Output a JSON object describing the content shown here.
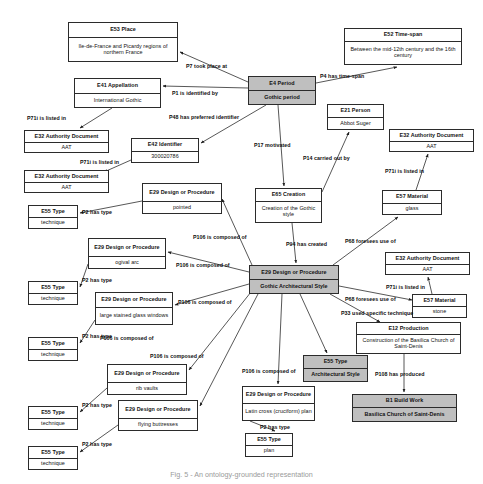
{
  "diagram": {
    "caption": "Fig. 5 - An ontology-grounded representation",
    "accent_shaded": "#bfbfbf",
    "stroke": "#2b2b2b"
  },
  "nodes": [
    {
      "id": "e53_place",
      "cls": "E53 Place",
      "val": "Ile-de-France and Picardy regions of northern France",
      "shaded": false,
      "x": 68,
      "y": 22,
      "w": 110,
      "h": 40,
      "clsh": 15
    },
    {
      "id": "e52_timespan",
      "cls": "E52 Time-span",
      "val": "Between the mid-12th century and the 16th century",
      "shaded": false,
      "x": 344,
      "y": 28,
      "w": 118,
      "h": 37,
      "clsh": 13
    },
    {
      "id": "e41_appellation",
      "cls": "E41 Appellation",
      "val": "International Gothic",
      "shaded": false,
      "x": 74,
      "y": 78,
      "w": 87,
      "h": 30,
      "clsh": 15
    },
    {
      "id": "e4_period",
      "cls": "E4 Period",
      "val": "Gothic period",
      "shaded": true,
      "x": 248,
      "y": 76,
      "w": 68,
      "h": 29,
      "clsh": 14
    },
    {
      "id": "e21_person",
      "cls": "E21 Person",
      "val": "Abbot Suger",
      "shaded": false,
      "x": 327,
      "y": 104,
      "w": 57,
      "h": 26,
      "clsh": 13
    },
    {
      "id": "e32_aat_1",
      "cls": "E32 Authority Document",
      "val": "AAT",
      "shaded": false,
      "x": 24,
      "y": 130,
      "w": 85,
      "h": 23,
      "clsh": 12
    },
    {
      "id": "e42_identifier",
      "cls": "E42 Identifier",
      "val": "300020786",
      "shaded": false,
      "x": 131,
      "y": 138,
      "w": 68,
      "h": 25,
      "clsh": 13
    },
    {
      "id": "e32_aat_2",
      "cls": "E32 Authority Document",
      "val": "AAT",
      "shaded": false,
      "x": 389,
      "y": 129,
      "w": 85,
      "h": 23,
      "clsh": 12
    },
    {
      "id": "e32_aat_3",
      "cls": "E32 Authority Document",
      "val": "AAT",
      "shaded": false,
      "x": 24,
      "y": 170,
      "w": 85,
      "h": 23,
      "clsh": 12
    },
    {
      "id": "e29_pointed",
      "cls": "E29 Design or Procedure",
      "val": "pointed",
      "shaded": false,
      "x": 142,
      "y": 183,
      "w": 80,
      "h": 31,
      "clsh": 18
    },
    {
      "id": "e65_creation",
      "cls": "E65 Creation",
      "val": "Creation of the Gothic style",
      "shaded": false,
      "x": 255,
      "y": 188,
      "w": 67,
      "h": 35,
      "clsh": 13
    },
    {
      "id": "e57_glass",
      "cls": "E57 Material",
      "val": "glass",
      "shaded": false,
      "x": 382,
      "y": 190,
      "w": 60,
      "h": 25,
      "clsh": 13
    },
    {
      "id": "e55_tech_1",
      "cls": "E55 Type",
      "val": "technique",
      "shaded": false,
      "x": 28,
      "y": 205,
      "w": 50,
      "h": 24,
      "clsh": 12
    },
    {
      "id": "e29_ogival",
      "cls": "E29 Design or Procedure",
      "val": "ogival arc",
      "shaded": false,
      "x": 88,
      "y": 238,
      "w": 78,
      "h": 31,
      "clsh": 18
    },
    {
      "id": "e32_aat_4",
      "cls": "E32 Authority Document",
      "val": "AAT",
      "shaded": false,
      "x": 385,
      "y": 252,
      "w": 85,
      "h": 23,
      "clsh": 12
    },
    {
      "id": "e55_tech_2",
      "cls": "E55 Type",
      "val": "technique",
      "shaded": false,
      "x": 28,
      "y": 281,
      "w": 50,
      "h": 24,
      "clsh": 12
    },
    {
      "id": "e29_hub",
      "cls": "E29 Design or Procedure",
      "val": "Gothic Architectural Style",
      "shaded": true,
      "x": 249,
      "y": 265,
      "w": 90,
      "h": 29,
      "clsh": 14
    },
    {
      "id": "e29_glass_win",
      "cls": "E29 Design or Procedure",
      "val": "large stained glass windows",
      "shaded": false,
      "x": 95,
      "y": 292,
      "w": 78,
      "h": 33,
      "clsh": 15
    },
    {
      "id": "e57_stone",
      "cls": "E57 Material",
      "val": "stone",
      "shaded": false,
      "x": 412,
      "y": 294,
      "w": 55,
      "h": 24,
      "clsh": 12
    },
    {
      "id": "e12_production",
      "cls": "E12 Production",
      "val": "Construction of the Basilica Church of Saint-Denis",
      "shaded": false,
      "x": 356,
      "y": 322,
      "w": 105,
      "h": 32,
      "clsh": 12
    },
    {
      "id": "e55_tech_3",
      "cls": "E55 Type",
      "val": "technique",
      "shaded": false,
      "x": 28,
      "y": 337,
      "w": 50,
      "h": 24,
      "clsh": 12
    },
    {
      "id": "e29_rib",
      "cls": "E29 Design or Procedure",
      "val": "rib vaults",
      "shaded": false,
      "x": 107,
      "y": 364,
      "w": 80,
      "h": 31,
      "clsh": 18
    },
    {
      "id": "e55_archstyle",
      "cls": "E55 Type",
      "val": "Architectural Style",
      "shaded": true,
      "x": 303,
      "y": 355,
      "w": 65,
      "h": 27,
      "clsh": 13
    },
    {
      "id": "e29_latincross",
      "cls": "E29 Design or Procedure",
      "val": "Latin cross (cruciform) plan",
      "shaded": false,
      "x": 242,
      "y": 386,
      "w": 73,
      "h": 35,
      "clsh": 17
    },
    {
      "id": "b1_buildwork",
      "cls": "B1 Build Work",
      "val": "Basilica Church of Saint-Denis",
      "shaded": true,
      "x": 352,
      "y": 394,
      "w": 105,
      "h": 28,
      "clsh": 13
    },
    {
      "id": "e55_tech_4",
      "cls": "E55 Type",
      "val": "technique",
      "shaded": false,
      "x": 28,
      "y": 406,
      "w": 50,
      "h": 24,
      "clsh": 12
    },
    {
      "id": "e29_flying",
      "cls": "E29 Design or Procedure",
      "val": "flying buttresses",
      "shaded": false,
      "x": 118,
      "y": 400,
      "w": 80,
      "h": 31,
      "clsh": 18
    },
    {
      "id": "e55_plan",
      "cls": "E55 Type",
      "val": "plan",
      "shaded": false,
      "x": 245,
      "y": 433,
      "w": 48,
      "h": 24,
      "clsh": 12
    },
    {
      "id": "e55_tech_5",
      "cls": "E55 Type",
      "val": "technique",
      "shaded": false,
      "x": 28,
      "y": 446,
      "w": 50,
      "h": 24,
      "clsh": 12
    }
  ],
  "edge_labels": [
    {
      "id": "p7",
      "text": "P7 took place at",
      "x": 186,
      "y": 63
    },
    {
      "id": "p4",
      "text": "P4 has time-span",
      "x": 320,
      "y": 73
    },
    {
      "id": "p1",
      "text": "P1 is identified by",
      "x": 172,
      "y": 90
    },
    {
      "id": "p71i_1",
      "text": "P71i is listed in",
      "x": 27,
      "y": 115
    },
    {
      "id": "p48",
      "text": "P48 has preferred identifier",
      "x": 169,
      "y": 114
    },
    {
      "id": "p71i_2",
      "text": "P71i is listed in",
      "x": 80,
      "y": 159
    },
    {
      "id": "p17",
      "text": "P17 motivated",
      "x": 254,
      "y": 142
    },
    {
      "id": "p14",
      "text": "P14 carried out by",
      "x": 303,
      "y": 155
    },
    {
      "id": "p71i_3",
      "text": "P71i is listed in",
      "x": 385,
      "y": 168
    },
    {
      "id": "p2_1",
      "text": "P2 has type",
      "x": 82,
      "y": 209
    },
    {
      "id": "p106_1",
      "text": "P106 is composed of",
      "x": 193,
      "y": 234
    },
    {
      "id": "p94",
      "text": "P94 has created",
      "x": 286,
      "y": 241
    },
    {
      "id": "p68_1",
      "text": "P68 foresees use of",
      "x": 345,
      "y": 238
    },
    {
      "id": "p106_2",
      "text": "P106 is composed of",
      "x": 176,
      "y": 262
    },
    {
      "id": "p71i_4",
      "text": "P71i is listed in",
      "x": 386,
      "y": 284
    },
    {
      "id": "p2_2",
      "text": "P2 has type",
      "x": 82,
      "y": 277
    },
    {
      "id": "p68_2",
      "text": "P68 foresees use of",
      "x": 345,
      "y": 296
    },
    {
      "id": "p106_3",
      "text": "P106 is composed of",
      "x": 178,
      "y": 299
    },
    {
      "id": "p33",
      "text": "P33 used specific technique",
      "x": 341,
      "y": 310
    },
    {
      "id": "p2_3",
      "text": "P2 has type",
      "x": 82,
      "y": 333
    },
    {
      "id": "p106_4",
      "text": "P106 is composed of",
      "x": 100,
      "y": 335
    },
    {
      "id": "p106_5",
      "text": "P106 is composed of",
      "x": 150,
      "y": 353
    },
    {
      "id": "p106_6",
      "text": "P106 is composed of",
      "x": 242,
      "y": 368
    },
    {
      "id": "p108",
      "text": "P108 has produced",
      "x": 375,
      "y": 371
    },
    {
      "id": "p2_4",
      "text": "P2 has type",
      "x": 82,
      "y": 402
    },
    {
      "id": "p2_5",
      "text": "P2 has type",
      "x": 260,
      "y": 424
    },
    {
      "id": "p2_6",
      "text": "P2 has type",
      "x": 82,
      "y": 441
    }
  ],
  "edges": [
    {
      "id": "e_p7",
      "from": "E4 Period",
      "to": "E53 Place",
      "path": "M 248,82 L 180,52"
    },
    {
      "id": "e_p4",
      "from": "E4 Period",
      "to": "E52 Time-span",
      "path": "M 316,83 L 397,67"
    },
    {
      "id": "e_p1",
      "from": "E4 Period",
      "to": "E41 Appellation",
      "path": "M 248,88 L 163,86"
    },
    {
      "id": "e_p71i_1",
      "from": "E41 Appellation",
      "to": "E32 Authority Document 1",
      "path": "M 112,108 L 80,128"
    },
    {
      "id": "e_p48",
      "from": "E4 Period",
      "to": "E42 Identifier",
      "path": "M 266,105 L 201,143"
    },
    {
      "id": "e_p71i_2",
      "from": "E42 Identifier",
      "to": "E32 Authority Document 3",
      "path": "M 131,160 L 104,172"
    },
    {
      "id": "e_p17",
      "from": "E4 Period",
      "to": "E65 Creation",
      "path": "M 278,105 L 284,186"
    },
    {
      "id": "e_p14",
      "from": "E65 Creation",
      "to": "E21 Person",
      "path": "M 322,192 L 349,132"
    },
    {
      "id": "e_p71i_3",
      "from": "E57 Material glass",
      "to": "E32 Authority Document 2",
      "path": "M 416,190 L 428,154"
    },
    {
      "id": "e_p2_1",
      "from": "E29 pointed",
      "to": "E55 Type technique 1",
      "path": "M 142,201 L 80,213"
    },
    {
      "id": "e_p106_1",
      "from": "E29 hub",
      "to": "E29 pointed",
      "path": "M 252,265 L 222,199"
    },
    {
      "id": "e_p94",
      "from": "E65 Creation",
      "to": "E29 hub",
      "path": "M 292,223 L 296,263"
    },
    {
      "id": "e_p68_1",
      "from": "E29 hub",
      "to": "E57 Material glass",
      "path": "M 333,265 L 398,217"
    },
    {
      "id": "e_p106_2",
      "from": "E29 hub",
      "to": "E29 ogival arc",
      "path": "M 249,272 L 168,252"
    },
    {
      "id": "e_p71i_4",
      "from": "E57 Material stone",
      "to": "E32 Authority Document 4",
      "path": "M 432,294 L 428,277"
    },
    {
      "id": "e_p2_2",
      "from": "E29 ogival arc",
      "to": "E55 Type technique 2",
      "path": "M 88,264 L 80,287"
    },
    {
      "id": "e_p68_2",
      "from": "E29 hub",
      "to": "E57 Material stone",
      "path": "M 339,286 L 412,300"
    },
    {
      "id": "e_p106_3",
      "from": "E29 hub",
      "to": "E29 large stained glass",
      "path": "M 249,284 L 175,305"
    },
    {
      "id": "e_p33",
      "from": "E29 hub",
      "to": "E12 Production",
      "path": "M 330,294 L 380,322"
    },
    {
      "id": "e_p2_3",
      "from": "E29 large stained glass",
      "to": "E55 Type technique 3",
      "path": "M 95,320 L 80,343"
    },
    {
      "id": "e_p106_4",
      "from": "E29 hub",
      "to": "E29 rib vaults",
      "path": "M 251,292 L 189,370"
    },
    {
      "id": "e_p106_5",
      "from": "E29 hub",
      "to": "E29 flying buttresses",
      "path": "M 258,294 L 200,406"
    },
    {
      "id": "e_p106_6",
      "from": "E29 hub",
      "to": "E29 Latin cross plan",
      "path": "M 282,294 L 278,384"
    },
    {
      "id": "e_p2_archstyle",
      "from": "E29 hub",
      "to": "E55 Type Architectural Style",
      "path": "M 300,294 L 327,353"
    },
    {
      "id": "e_p108",
      "from": "E12 Production",
      "to": "B1 Build Work",
      "path": "M 404,354 L 404,392"
    },
    {
      "id": "e_p2_4",
      "from": "E29 rib vaults",
      "to": "E55 Type technique 4",
      "path": "M 107,388 L 80,412"
    },
    {
      "id": "e_p2_5",
      "from": "E29 Latin cross plan",
      "to": "E55 Type plan",
      "path": "M 250,421 L 275,431"
    },
    {
      "id": "e_p2_6",
      "from": "E29 flying buttresses",
      "to": "E55 Type technique 5",
      "path": "M 118,425 L 80,452"
    }
  ]
}
